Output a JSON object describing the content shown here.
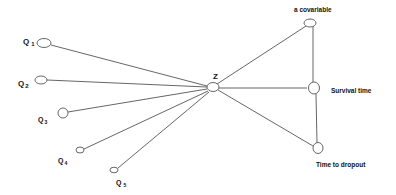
{
  "diagram": {
    "nodes": {
      "q1": {
        "label": "Q",
        "sub": "1"
      },
      "q2": {
        "label": "Q",
        "sub": "2"
      },
      "q3": {
        "label": "Q",
        "sub": "3"
      },
      "q4": {
        "label": "Q",
        "sub": "4"
      },
      "q5": {
        "label": "Q",
        "sub": "5"
      },
      "z": {
        "label": "Z"
      },
      "covariable": {
        "label": "a covariable"
      },
      "survival": {
        "label": "Survival time"
      },
      "dropout": {
        "label": "Time to dropout"
      }
    },
    "edges": [
      {
        "from": "q1",
        "to": "z"
      },
      {
        "from": "q2",
        "to": "z"
      },
      {
        "from": "q3",
        "to": "z"
      },
      {
        "from": "q4",
        "to": "z"
      },
      {
        "from": "q5",
        "to": "z"
      },
      {
        "from": "z",
        "to": "covariable"
      },
      {
        "from": "z",
        "to": "survival"
      },
      {
        "from": "z",
        "to": "dropout"
      },
      {
        "from": "covariable",
        "to": "survival"
      },
      {
        "from": "survival",
        "to": "dropout"
      }
    ],
    "colors": {
      "line": "#555555",
      "text": "#111111",
      "background": "#ffffff"
    }
  }
}
